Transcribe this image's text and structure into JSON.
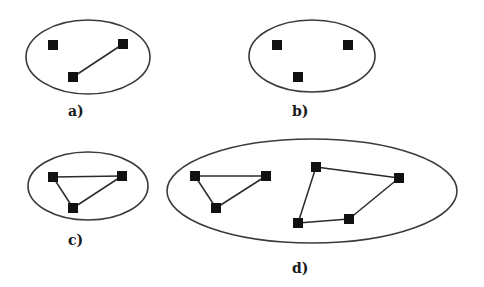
{
  "diagram": {
    "node_size": 10,
    "colors": {
      "node": "#111111",
      "edge": "#2a2a2a",
      "boundary": "#3a3a3a",
      "background": "#ffffff"
    },
    "panels": [
      {
        "id": "a",
        "label": "a)",
        "label_pos": [
          68,
          116
        ],
        "ellipse": {
          "cx": 88,
          "cy": 57,
          "rx": 62,
          "ry": 37
        },
        "nodes": [
          [
            53,
            45
          ],
          [
            123,
            44
          ],
          [
            73,
            77
          ]
        ],
        "edges": [
          [
            1,
            2
          ]
        ]
      },
      {
        "id": "b",
        "label": "b)",
        "label_pos": [
          292,
          116
        ],
        "ellipse": {
          "cx": 312,
          "cy": 56,
          "rx": 63,
          "ry": 36
        },
        "nodes": [
          [
            277,
            45
          ],
          [
            348,
            45
          ],
          [
            298,
            77
          ]
        ],
        "edges": []
      },
      {
        "id": "c",
        "label": "c)",
        "label_pos": [
          68,
          245
        ],
        "ellipse": {
          "cx": 88,
          "cy": 186,
          "rx": 60,
          "ry": 34
        },
        "nodes": [
          [
            53,
            177
          ],
          [
            122,
            176
          ],
          [
            73,
            208
          ]
        ],
        "edges": [
          [
            0,
            1
          ],
          [
            0,
            2
          ],
          [
            1,
            2
          ]
        ]
      },
      {
        "id": "d",
        "label": "d)",
        "label_pos": [
          292,
          273
        ],
        "ellipse": {
          "cx": 312,
          "cy": 191,
          "rx": 145,
          "ry": 52
        },
        "nodes": [
          [
            195,
            176
          ],
          [
            266,
            176
          ],
          [
            216,
            208
          ],
          [
            316,
            167
          ],
          [
            399,
            178
          ],
          [
            349,
            219
          ],
          [
            298,
            223
          ]
        ],
        "edges": [
          [
            0,
            1
          ],
          [
            0,
            2
          ],
          [
            1,
            2
          ],
          [
            3,
            4
          ],
          [
            4,
            5
          ],
          [
            5,
            6
          ],
          [
            6,
            3
          ]
        ]
      }
    ]
  }
}
